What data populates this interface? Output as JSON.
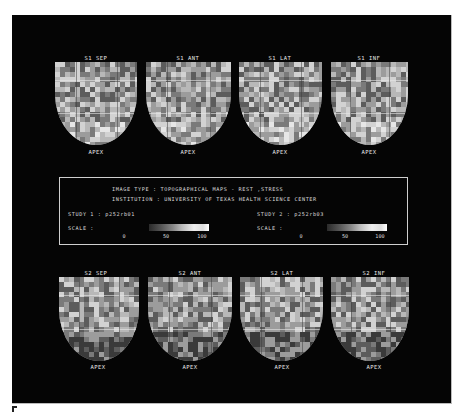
{
  "figure": {
    "panel_letter": "E",
    "background_color": "#050505"
  },
  "top_row": [
    {
      "label": "S1 SEP",
      "bottom_label": "APEX"
    },
    {
      "label": "S1 ANT",
      "bottom_label": "APEX"
    },
    {
      "label": "S1 LAT",
      "bottom_label": "APEX"
    },
    {
      "label": "S1 INF",
      "bottom_label": "APEX"
    }
  ],
  "bottom_row": [
    {
      "label": "S2 SEP",
      "bottom_label": "APEX"
    },
    {
      "label": "S2 ANT",
      "bottom_label": "APEX"
    },
    {
      "label": "S2 LAT",
      "bottom_label": "APEX"
    },
    {
      "label": "S2 INF",
      "bottom_label": "APEX"
    }
  ],
  "info": {
    "image_type_label": "IMAGE TYPE",
    "image_type_value": "TOPOGRAPHICAL MAPS - REST ,STRESS",
    "institution_label": "INSTITUTION",
    "institution_value": "UNIVERSITY OF TEXAS HEALTH SCIENCE CENTER",
    "study1_label": "STUDY 1",
    "study1_value": "p252rb01",
    "study2_label": "STUDY 2",
    "study2_value": "p252rb03",
    "scale_label": "SCALE",
    "separator": ":",
    "scale_ticks": [
      "0",
      "50",
      "100"
    ]
  }
}
